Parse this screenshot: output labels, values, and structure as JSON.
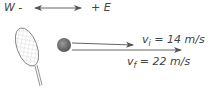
{
  "direction": {
    "west_label": "W -",
    "east_label": "+ E"
  },
  "velocities": {
    "initial": {
      "symbol": "v",
      "subscript": "i",
      "text": "= 14 m/s"
    },
    "final": {
      "symbol": "v",
      "subscript": "f",
      "text": "= 22 m/s"
    }
  },
  "colors": {
    "line": "#666666",
    "ball": "#777777",
    "text": "#444444"
  }
}
